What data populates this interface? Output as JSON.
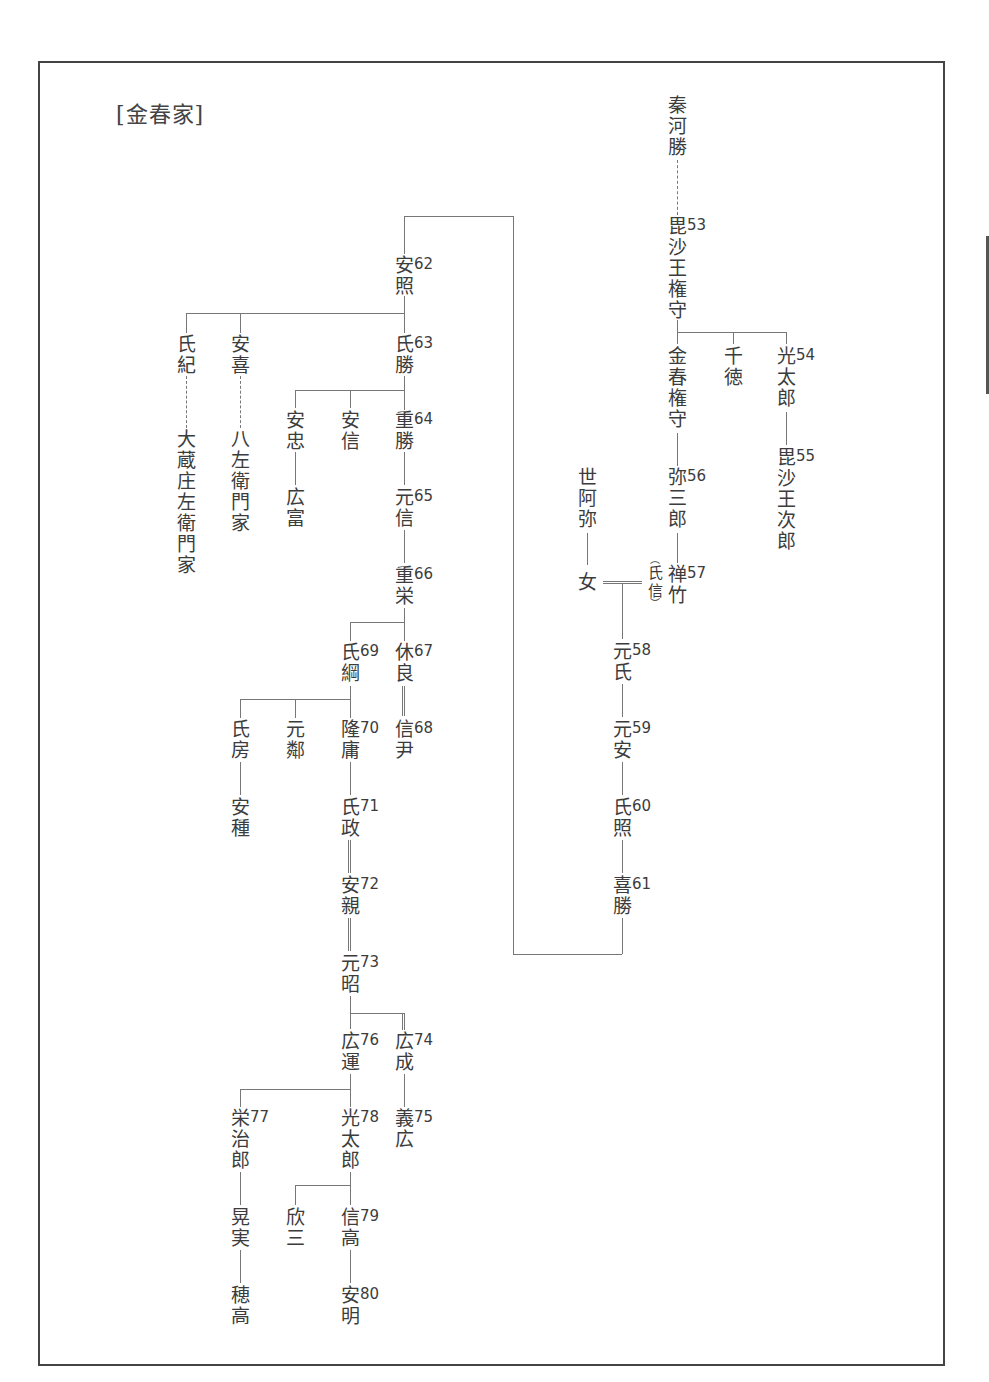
{
  "title": "[金春家]",
  "nodes": {
    "hata_kawakatsu": {
      "name": [
        "秦",
        "河",
        "勝"
      ],
      "num": ""
    },
    "bishao_gonnokami": {
      "name": [
        "毘",
        "沙",
        "王",
        "権",
        "守"
      ],
      "num": "53"
    },
    "konparu_gonnokami": {
      "name": [
        "金",
        "春",
        "権",
        "守"
      ],
      "num": ""
    },
    "sentoku": {
      "name": [
        "千",
        "徳"
      ],
      "num": ""
    },
    "mitsutaro": {
      "name": [
        "光",
        "太",
        "郎"
      ],
      "num": "54"
    },
    "bishao_jiro": {
      "name": [
        "毘",
        "沙",
        "王",
        "次",
        "郎"
      ],
      "num": "55"
    },
    "yasaburo": {
      "name": [
        "弥",
        "三",
        "郎"
      ],
      "num": "56"
    },
    "zeami": {
      "name": [
        "世",
        "阿",
        "弥"
      ],
      "num": ""
    },
    "onna": {
      "name": [
        "女"
      ],
      "num": ""
    },
    "zenchiku": {
      "name": [
        "禅",
        "竹"
      ],
      "num": "57"
    },
    "ujinobu_alias": {
      "name": [
        "氏",
        "信"
      ],
      "num": ""
    },
    "motouji": {
      "name": [
        "元",
        "氏"
      ],
      "num": "58"
    },
    "motoyasu": {
      "name": [
        "元",
        "安"
      ],
      "num": "59"
    },
    "ujiteru": {
      "name": [
        "氏",
        "照"
      ],
      "num": "60"
    },
    "yoshikatsu": {
      "name": [
        "喜",
        "勝"
      ],
      "num": "61"
    },
    "yasuteru": {
      "name": [
        "安",
        "照"
      ],
      "num": "62"
    },
    "ujinori": {
      "name": [
        "氏",
        "紀"
      ],
      "num": ""
    },
    "ookura": {
      "name": [
        "大",
        "蔵",
        "庄",
        "左",
        "衛",
        "門",
        "家"
      ],
      "num": ""
    },
    "yasuyoshi": {
      "name": [
        "安",
        "喜"
      ],
      "num": ""
    },
    "hachizaemon": {
      "name": [
        "八",
        "左",
        "衛",
        "門",
        "家"
      ],
      "num": ""
    },
    "ujikatsu": {
      "name": [
        "氏",
        "勝"
      ],
      "num": "63"
    },
    "yasutada": {
      "name": [
        "安",
        "忠"
      ],
      "num": ""
    },
    "hirotomi": {
      "name": [
        "広",
        "富"
      ],
      "num": ""
    },
    "yasunobu": {
      "name": [
        "安",
        "信"
      ],
      "num": ""
    },
    "shigekatsu": {
      "name": [
        "重",
        "勝"
      ],
      "num": "64"
    },
    "motonobu": {
      "name": [
        "元",
        "信"
      ],
      "num": "65"
    },
    "shigeyoshi": {
      "name": [
        "重",
        "栄"
      ],
      "num": "66"
    },
    "kyuryo": {
      "name": [
        "休",
        "良"
      ],
      "num": "67"
    },
    "nobutada": {
      "name": [
        "信",
        "尹"
      ],
      "num": "68"
    },
    "ujitsuna": {
      "name": [
        "氏",
        "綱"
      ],
      "num": "69"
    },
    "ujifusa": {
      "name": [
        "氏",
        "房"
      ],
      "num": ""
    },
    "yasutane": {
      "name": [
        "安",
        "種"
      ],
      "num": ""
    },
    "motochika": {
      "name": [
        "元",
        "鄰"
      ],
      "num": ""
    },
    "takayasu": {
      "name": [
        "隆",
        "庸"
      ],
      "num": "70"
    },
    "ujimasa": {
      "name": [
        "氏",
        "政"
      ],
      "num": "71"
    },
    "yasuchika": {
      "name": [
        "安",
        "親"
      ],
      "num": "72"
    },
    "motoaki": {
      "name": [
        "元",
        "昭"
      ],
      "num": "73"
    },
    "hironari": {
      "name": [
        "広",
        "成"
      ],
      "num": "74"
    },
    "yoshihiro": {
      "name": [
        "義",
        "広"
      ],
      "num": "75"
    },
    "hirokazu": {
      "name": [
        "広",
        "運"
      ],
      "num": "76"
    },
    "eijiro": {
      "name": [
        "栄",
        "治",
        "郎"
      ],
      "num": "77"
    },
    "koshi": {
      "name": [
        "晃",
        "実"
      ],
      "num": ""
    },
    "hotaka": {
      "name": [
        "穂",
        "高"
      ],
      "num": ""
    },
    "mitsutaro2": {
      "name": [
        "光",
        "太",
        "郎"
      ],
      "num": "78"
    },
    "kinzo": {
      "name": [
        "欣",
        "三"
      ],
      "num": ""
    },
    "nobutaka": {
      "name": [
        "信",
        "高"
      ],
      "num": "79"
    },
    "yasuaki": {
      "name": [
        "安",
        "明"
      ],
      "num": "80"
    }
  }
}
